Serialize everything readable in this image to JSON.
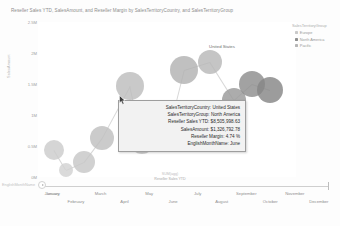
{
  "chart": {
    "title": "Reseller Sales YTD, SalesAmount, and Reseller Margin by SalesTerritoryCountry, and SalesTerritoryGroup",
    "y_axis_title": "SalesAmount",
    "x_axis_title_line1": "SUM(agg)",
    "x_axis_title_line2": "Reseller Sales YTD"
  },
  "legend": {
    "title": "SalesTerritoryGroup",
    "items": [
      {
        "label": "Europe",
        "color": "#c9c9c9"
      },
      {
        "label": "North America",
        "color": "#8f8f8f"
      },
      {
        "label": "Pacific",
        "color": "#b6b6b6"
      }
    ]
  },
  "y_ticks": [
    "2.5M",
    "2M",
    "1.5M",
    "1M",
    "0.5M",
    "0M"
  ],
  "x_ticks_row1": [
    "January",
    "March",
    "May",
    "July",
    "September",
    "November"
  ],
  "x_ticks_row2": [
    "February",
    "April",
    "June",
    "August",
    "October",
    "December"
  ],
  "play_control": {
    "field_label": "EnglishMonthName",
    "play_icon": "play-icon",
    "current_value": "January"
  },
  "tooltip": {
    "rows": [
      {
        "key": "SalesTerritoryCountry:",
        "value": "United States"
      },
      {
        "key": "SalesTerritoryGroup:",
        "value": "North America"
      },
      {
        "key": "Reseller Sales YTD:",
        "value": "$8,505,998.63"
      },
      {
        "key": "SalesAmount:",
        "value": "$1,326,792.78"
      },
      {
        "key": "Reseller Margin:",
        "value": "4.74 %"
      },
      {
        "key": "EnglishMonthName:",
        "value": "June"
      }
    ]
  },
  "point_labels": [
    {
      "text": "United States",
      "x": 222,
      "y": 46
    }
  ],
  "chart_data": {
    "type": "scatter",
    "title": "Reseller Sales YTD, SalesAmount, and Reseller Margin by SalesTerritoryCountry, and SalesTerritoryGroup",
    "xlabel": "Reseller Sales YTD",
    "ylabel": "SalesAmount",
    "size_measure": "Reseller Margin",
    "color_measure": "SalesTerritoryGroup",
    "animation_field": "EnglishMonthName",
    "animation_frame": "June",
    "grid": false,
    "legend_position": "right",
    "ylim": [
      0,
      2500000
    ],
    "ytick_labels": [
      "0M",
      "0.5M",
      "1M",
      "1.5M",
      "2M",
      "2.5M"
    ],
    "xtick_labels": [
      "January",
      "February",
      "March",
      "April",
      "May",
      "June",
      "July",
      "August",
      "September",
      "October",
      "November",
      "December"
    ],
    "points": [
      {
        "label": "France",
        "group": "Europe",
        "cx": 16,
        "cy": 128,
        "r": 10,
        "color": "#cccccc"
      },
      {
        "label": "Germany",
        "group": "Europe",
        "cx": 28,
        "cy": 148,
        "r": 7,
        "color": "#d2d2d2"
      },
      {
        "label": "United Kingdom",
        "group": "Europe",
        "cx": 46,
        "cy": 140,
        "r": 11,
        "color": "#c7c7c7"
      },
      {
        "label": "Australia",
        "group": "Pacific",
        "cx": 64,
        "cy": 116,
        "r": 12,
        "color": "#c0c0c0"
      },
      {
        "label": "Canada",
        "group": "North America",
        "cx": 92,
        "cy": 64,
        "r": 14,
        "color": "#bdbdbd"
      },
      {
        "label": "Canada-2",
        "group": "North America",
        "cx": 104,
        "cy": 120,
        "r": 12,
        "color": "#c4c4c4"
      },
      {
        "label": "NA-mid",
        "group": "North America",
        "cx": 135,
        "cy": 92,
        "r": 9,
        "color": "#c2c2c2"
      },
      {
        "label": "NA-mid2",
        "group": "North America",
        "cx": 146,
        "cy": 48,
        "r": 14,
        "color": "#b2b2b2"
      },
      {
        "label": "NA-mid3",
        "group": "North America",
        "cx": 172,
        "cy": 40,
        "r": 12,
        "color": "#b8b8b8"
      },
      {
        "label": "US-a",
        "group": "North America",
        "cx": 196,
        "cy": 78,
        "r": 12,
        "color": "#9a9a9a"
      },
      {
        "label": "United States",
        "group": "North America",
        "cx": 214,
        "cy": 62,
        "r": 13,
        "color": "#8d8d8d"
      },
      {
        "label": "US-b",
        "group": "North America",
        "cx": 232,
        "cy": 68,
        "r": 13,
        "color": "#868686"
      }
    ],
    "trails": [
      {
        "x1": 16,
        "y1": 128,
        "x2": 28,
        "y2": 148
      },
      {
        "x1": 28,
        "y1": 148,
        "x2": 46,
        "y2": 140
      },
      {
        "x1": 46,
        "y1": 140,
        "x2": 64,
        "y2": 116
      },
      {
        "x1": 64,
        "y1": 116,
        "x2": 92,
        "y2": 64
      },
      {
        "x1": 92,
        "y1": 64,
        "x2": 104,
        "y2": 120
      },
      {
        "x1": 104,
        "y1": 120,
        "x2": 135,
        "y2": 92
      },
      {
        "x1": 135,
        "y1": 92,
        "x2": 146,
        "y2": 48
      },
      {
        "x1": 146,
        "y1": 48,
        "x2": 172,
        "y2": 40
      },
      {
        "x1": 172,
        "y1": 40,
        "x2": 196,
        "y2": 78
      },
      {
        "x1": 196,
        "y1": 78,
        "x2": 214,
        "y2": 62
      },
      {
        "x1": 214,
        "y1": 62,
        "x2": 232,
        "y2": 68
      }
    ]
  }
}
